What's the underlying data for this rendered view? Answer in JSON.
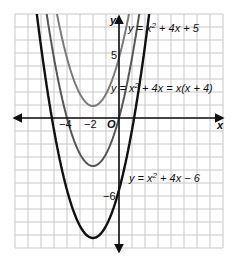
{
  "figure": {
    "axes": {
      "x_label": "x",
      "y_label": "y",
      "origin_label": "O",
      "x_ticks": [
        "−4",
        "−2"
      ],
      "y_ticks": [
        "5",
        "−6"
      ],
      "xlim": [
        -8,
        8
      ],
      "ylim": [
        -10.5,
        8.5
      ],
      "grid": true
    },
    "curves": [
      {
        "name": "upper",
        "equation": "y = x² + 4x + 5",
        "label_parts": [
          "y = x",
          "2",
          " + 4x + 5"
        ],
        "color": "#7a7a7a",
        "a": 1,
        "b": 4,
        "c": 5
      },
      {
        "name": "middle",
        "equation": "y = x² + 4x = x(x + 4)",
        "label_parts": [
          "y = x",
          "2",
          " + 4x = x(x + 4)"
        ],
        "color": "#555555",
        "a": 1,
        "b": 4,
        "c": 0
      },
      {
        "name": "lower",
        "equation": "y = x² + 4x − 6",
        "label_parts": [
          "y = x",
          "2",
          " + 4x − 6"
        ],
        "color": "#111111",
        "a": 1,
        "b": 4,
        "c": -6
      }
    ]
  },
  "chart_data": {
    "type": "line",
    "title": "",
    "xlabel": "x",
    "ylabel": "y",
    "grid": true,
    "series": [
      {
        "name": "y = x² + 4x + 5",
        "vertex": [
          -2,
          1
        ],
        "y_intercept": 5
      },
      {
        "name": "y = x² + 4x = x(x + 4)",
        "vertex": [
          -2,
          -4
        ],
        "y_intercept": 0,
        "roots": [
          -4,
          0
        ]
      },
      {
        "name": "y = x² + 4x − 6",
        "vertex": [
          -2,
          -10
        ],
        "y_intercept": -6,
        "roots": [
          -5.16,
          1.16
        ]
      }
    ],
    "x_ticks": [
      -4,
      -2
    ],
    "y_ticks": [
      5,
      -6
    ]
  }
}
